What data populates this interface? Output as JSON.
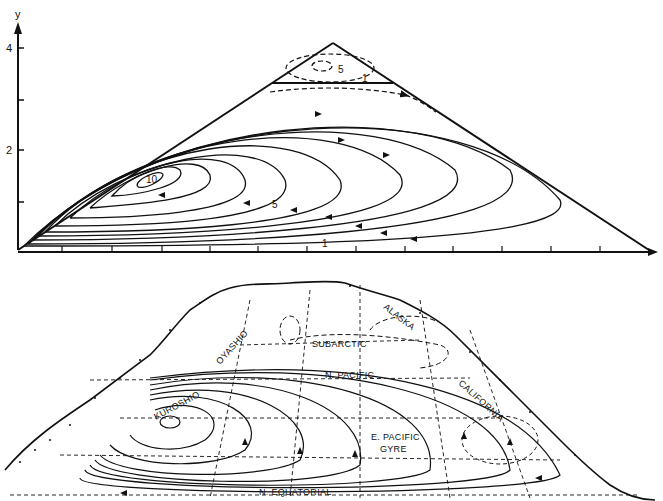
{
  "figure": {
    "top_panel": {
      "title": "Model wind-driven circulation in triangular basin",
      "y_axis": {
        "label": "y",
        "ticks": [
          "4",
          "2"
        ],
        "minor_ticks": [
          1,
          3
        ]
      },
      "x_axis": {
        "label": "",
        "tick_count": 14
      },
      "contour_labels": {
        "center": "10",
        "middle": "5",
        "outer": "1",
        "upper_gyre_inner": "5",
        "upper_gyre_outer": "1"
      }
    },
    "bottom_panel": {
      "title": "North Pacific surface circulation",
      "current_labels": {
        "kuroshio": "KUROSHIO",
        "oyashio": "OYASHIO",
        "subarctic": "SUBARCTIC",
        "alaska": "ALASKA",
        "n_pacific": "N. PACIFIC",
        "california": "CALIFORNIA",
        "e_pacific_gyre_1": "E. PACIFIC",
        "e_pacific_gyre_2": "GYRE",
        "n_equatorial": "N. EQUATORIAL"
      }
    },
    "colors": {
      "ink": "#111111",
      "background": "#ffffff"
    }
  }
}
